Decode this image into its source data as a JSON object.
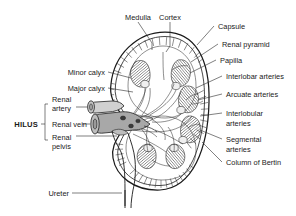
{
  "figure": {
    "colors": {
      "ink": "#1a1a1a",
      "leader": "#2a2a2a",
      "vessel_fill": "#a8a8a8",
      "pyramid_fill": "#8c8c8c",
      "background": "#ffffff"
    }
  },
  "labels": {
    "top": [
      {
        "id": "medulla",
        "text": "Medulla"
      },
      {
        "id": "cortex",
        "text": "Cortex"
      }
    ],
    "right": [
      {
        "id": "capsule",
        "text": "Capsule"
      },
      {
        "id": "renal-pyramid",
        "text": "Renal pyramid"
      },
      {
        "id": "papilla",
        "text": "Papilla"
      },
      {
        "id": "interlobar-arteries",
        "text": "Interlobar arteries"
      },
      {
        "id": "arcuate-arteries",
        "text": "Arcuate arteries"
      },
      {
        "id": "interlobular-arteries",
        "text": "Interlobular",
        "text2": "arteries"
      },
      {
        "id": "segmental-arteries",
        "text": "Segmental",
        "text2": "arteries"
      },
      {
        "id": "column-of-bertin",
        "text": "Column of Bertin"
      }
    ],
    "left": [
      {
        "id": "minor-calyx",
        "text": "Minor calyx"
      },
      {
        "id": "major-calyx",
        "text": "Major calyx"
      },
      {
        "id": "renal-artery",
        "text": "Renal",
        "text2": "artery"
      },
      {
        "id": "renal-vein",
        "text": "Renal vein"
      },
      {
        "id": "renal-pelvis",
        "text": "Renal",
        "text2": "pelvis"
      }
    ],
    "bracket": {
      "id": "hilus",
      "text": "HILUS"
    },
    "bottom": [
      {
        "id": "ureter",
        "text": "Ureter"
      }
    ]
  }
}
